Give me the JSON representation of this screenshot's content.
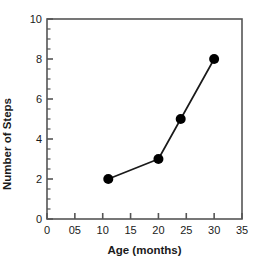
{
  "chart_data": {
    "type": "line",
    "title": "",
    "xlabel": "Age (months)",
    "ylabel": "Number of Steps",
    "x": [
      11,
      20,
      24,
      30
    ],
    "values": [
      2,
      3,
      5,
      8
    ],
    "series": [
      {
        "name": "Number of Steps",
        "points": [
          {
            "x": 11,
            "y": 2
          },
          {
            "x": 20,
            "y": 3
          },
          {
            "x": 24,
            "y": 5
          },
          {
            "x": 30,
            "y": 8
          }
        ]
      }
    ],
    "xlim": [
      0,
      35
    ],
    "ylim": [
      0,
      10
    ],
    "xticks": [
      0,
      5,
      10,
      15,
      20,
      25,
      30,
      35
    ],
    "xtick_labels": [
      "0",
      "05",
      "10",
      "15",
      "20",
      "25",
      "30",
      "35"
    ],
    "yticks": [
      0,
      2,
      4,
      6,
      8,
      10
    ],
    "ytick_labels": [
      "0",
      "2",
      "4",
      "6",
      "8",
      "10"
    ],
    "y_minor_step": 0.5,
    "grid": false,
    "legend": null,
    "marker": "filled-circle",
    "marker_color": "#000000",
    "line_color": "#1a1a1a",
    "frame_color": "#555555",
    "background": "#ffffff"
  }
}
